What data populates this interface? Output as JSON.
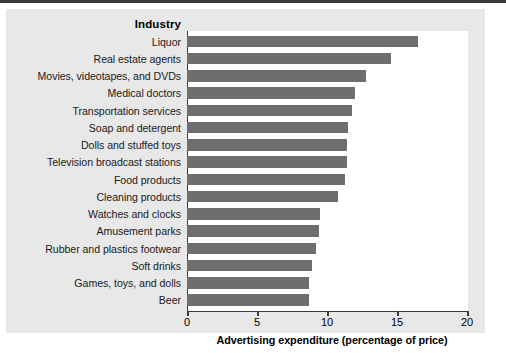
{
  "figure": {
    "panel_background": "#e8e8e8",
    "plot_background": "#ffffff",
    "bar_color": "#6e6e6e",
    "axis_color": "#3a3a3a"
  },
  "header": {
    "category_column_label": "Industry"
  },
  "chart_data": {
    "type": "bar",
    "orientation": "horizontal",
    "title": "",
    "subtitle": "",
    "xlabel": "Advertising expenditure (percentage of price)",
    "ylabel": "Industry",
    "xlim": [
      0,
      20
    ],
    "xticks": [
      0,
      5,
      10,
      15,
      20
    ],
    "xtick_labels": [
      "0",
      "5",
      "10",
      "15",
      "20"
    ],
    "grid": false,
    "legend": null,
    "categories": [
      "Liquor",
      "Real estate agents",
      "Movies, videotapes, and DVDs",
      "Medical doctors",
      "Transportation services",
      "Soap and detergent",
      "Dolls and stuffed toys",
      "Television broadcast stations",
      "Food products",
      "Cleaning products",
      "Watches and clocks",
      "Amusement parks",
      "Rubber and plastics footwear",
      "Soft drinks",
      "Games, toys, and dolls",
      "Beer"
    ],
    "values": [
      16.5,
      14.6,
      12.8,
      12.0,
      11.8,
      11.5,
      11.4,
      11.4,
      11.3,
      10.8,
      9.5,
      9.4,
      9.2,
      8.9,
      8.7,
      8.7
    ]
  }
}
